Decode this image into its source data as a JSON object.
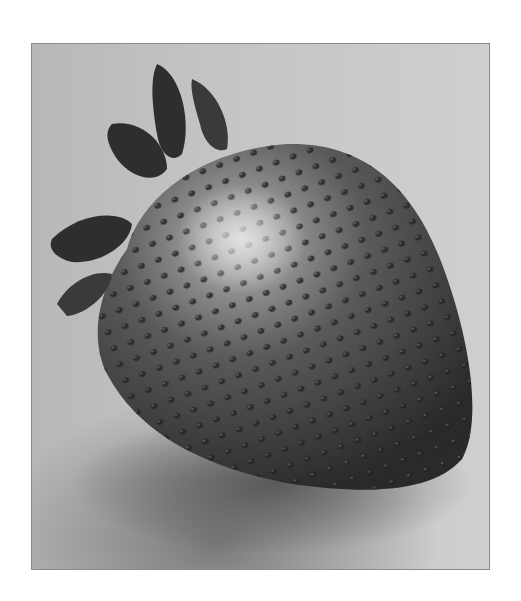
{
  "image": {
    "subject": "strawberry",
    "style": "grayscale photograph",
    "colors": {
      "background_light": "#cfcfcf",
      "background_dark": "#b8b8b8",
      "berry_dark": "#3a3a3a",
      "berry_mid": "#5a5a5a",
      "highlight": "#d8d8d8",
      "leaf": "#2e2e2e",
      "border": "#8a8a8a"
    }
  }
}
